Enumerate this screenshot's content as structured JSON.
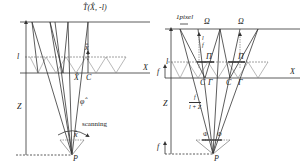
{
  "left_panel": {
    "top_label": "T̂(X̂, -l)",
    "l_label": "l",
    "z_label": "Z",
    "x_axis_label": "X",
    "xhat_top_label": "x̂",
    "xhat_bottom_label": "X̂",
    "c_label": "C",
    "phi_label": "φ̂",
    "scanning_label": "scanning",
    "lower_xhat_label": "x̂",
    "p_label": "P"
  },
  "right_panel": {
    "pixel_label": "1pixel",
    "omega_left": "Ω",
    "omega_right": "Ω",
    "l_over_f_num": "l",
    "l_over_f_den": "f",
    "pi_left": "Π",
    "pi_right": "Π",
    "l_label": "l",
    "f_upper_label": "f",
    "x_axis_label": "X",
    "c_left": "C",
    "gamma_left": "Γ",
    "c_right": "C",
    "gamma_right": "Γ",
    "z_label": "Z",
    "frac_num": "f",
    "frac_den": "l + Z",
    "phi_left": "Φ",
    "phi_right": "Φ",
    "f_lower_label": "f",
    "p_label": "P"
  },
  "colors": {
    "line": "#333333",
    "light": "#888888",
    "grid": "#999999"
  }
}
